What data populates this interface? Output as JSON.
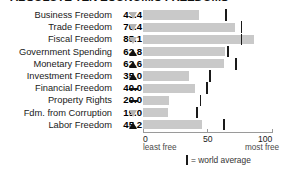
{
  "title": "ABSOLUTE TEN ECONOMIC FREEDOMS",
  "chart_data": {
    "type": "bar",
    "title": "ABSOLUTE TEN ECONOMIC FREEDOMS",
    "xlabel": "",
    "ylabel": "",
    "xlim": [
      0,
      100
    ],
    "grid": false,
    "legend_position": "bottom",
    "axis": {
      "ticks": [
        {
          "value": 0,
          "label": "0",
          "sublabel": "least free"
        },
        {
          "value": 50,
          "label": "50",
          "sublabel": ""
        },
        {
          "value": 100,
          "label": "100",
          "sublabel": "most free"
        }
      ]
    },
    "legend": [
      {
        "marker": "world-average-tick",
        "label": "= world average"
      }
    ],
    "categories": [
      "Business Freedom",
      "Trade Freedom",
      "Fiscal Freedom",
      "Government Spending",
      "Monetary Freedom",
      "Investment Freedom",
      "Financial Freedom",
      "Property Rights",
      "Fdm. from Corruption",
      "Labor Freedom"
    ],
    "values": [
      43.4,
      70.4,
      85.1,
      62.8,
      62.6,
      35.0,
      40.0,
      20.0,
      19.0,
      45.2
    ],
    "value_labels": [
      "43.4",
      "70.4",
      "85.1",
      "62.8",
      "62.6",
      "35.0",
      "40.0",
      "20.0",
      "19.0",
      "45.2"
    ],
    "trends": [
      "down",
      "down",
      "down",
      "up",
      "up",
      "up",
      "flat",
      "flat",
      "down",
      "up"
    ],
    "series": [
      {
        "name": "World average",
        "values": [
          63.0,
          75.0,
          75.0,
          64.5,
          70.5,
          50.5,
          48.5,
          43.5,
          40.5,
          61.5
        ]
      }
    ]
  },
  "rows": [
    {
      "label": "Business Freedom",
      "value": "43.4",
      "bar": 43.4,
      "avg": 63.0,
      "trend": "down"
    },
    {
      "label": "Trade Freedom",
      "value": "70.4",
      "bar": 70.4,
      "avg": 75.0,
      "trend": "down"
    },
    {
      "label": "Fiscal Freedom",
      "value": "85.1",
      "bar": 85.1,
      "avg": 75.0,
      "trend": "down"
    },
    {
      "label": "Government Spending",
      "value": "62.8",
      "bar": 62.8,
      "avg": 64.5,
      "trend": "up"
    },
    {
      "label": "Monetary Freedom",
      "value": "62.6",
      "bar": 62.6,
      "avg": 70.5,
      "trend": "up"
    },
    {
      "label": "Investment Freedom",
      "value": "35.0",
      "bar": 35.0,
      "avg": 50.5,
      "trend": "up"
    },
    {
      "label": "Financial Freedom",
      "value": "40.0",
      "bar": 40.0,
      "avg": 48.5,
      "trend": "flat"
    },
    {
      "label": "Property Rights",
      "value": "20.0",
      "bar": 20.0,
      "avg": 43.5,
      "trend": "flat"
    },
    {
      "label": "Fdm. from Corruption",
      "value": "19.0",
      "bar": 19.0,
      "avg": 40.5,
      "trend": "down"
    },
    {
      "label": "Labor Freedom",
      "value": "45.2",
      "bar": 45.2,
      "avg": 61.5,
      "trend": "up"
    }
  ],
  "axis": {
    "min_label": "0",
    "mid_label": "50",
    "max_label": "100",
    "min_sub": "least free",
    "max_sub": "most free"
  },
  "legend": {
    "text": "= world average"
  },
  "colors": {
    "bar": "#c9c9c9",
    "tick": "#1a1a1a",
    "text": "#1a1a1a",
    "axis": "#9a9a9a",
    "trend_up": "#111111",
    "trend_down": "#b4b4b4"
  }
}
